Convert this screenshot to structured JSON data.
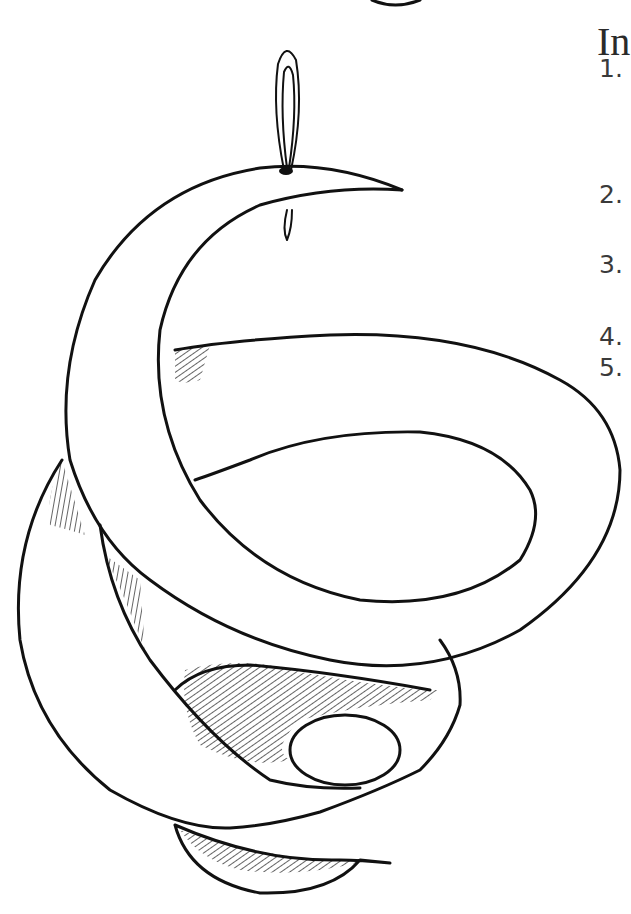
{
  "page": {
    "heading": "In",
    "steps": [
      {
        "number": "1.",
        "top": 54
      },
      {
        "number": "2.",
        "top": 180
      },
      {
        "number": "3.",
        "top": 250
      },
      {
        "number": "4.",
        "top": 322
      },
      {
        "number": "5.",
        "top": 353
      }
    ]
  },
  "illustration": {
    "subject": "spiral paper mobile with hanging string loop",
    "stroke_color": "#111111",
    "background_color": "#ffffff"
  }
}
